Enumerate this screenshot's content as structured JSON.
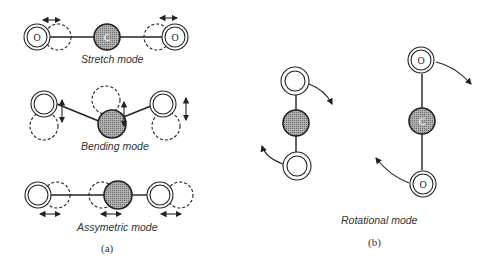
{
  "panel_a": {
    "stretch_label": "Stretch mode",
    "bending_label": "Bending mode",
    "asym_label": "Assymetric mode",
    "caption": "(a)"
  },
  "panel_b": {
    "rot_label": "Rotational mode",
    "caption": "(b)"
  },
  "atoms": {
    "oxygen": "O",
    "carbon": "C"
  },
  "colors": {
    "line": "#222222",
    "carbon_fill": "#9a9a9a"
  }
}
